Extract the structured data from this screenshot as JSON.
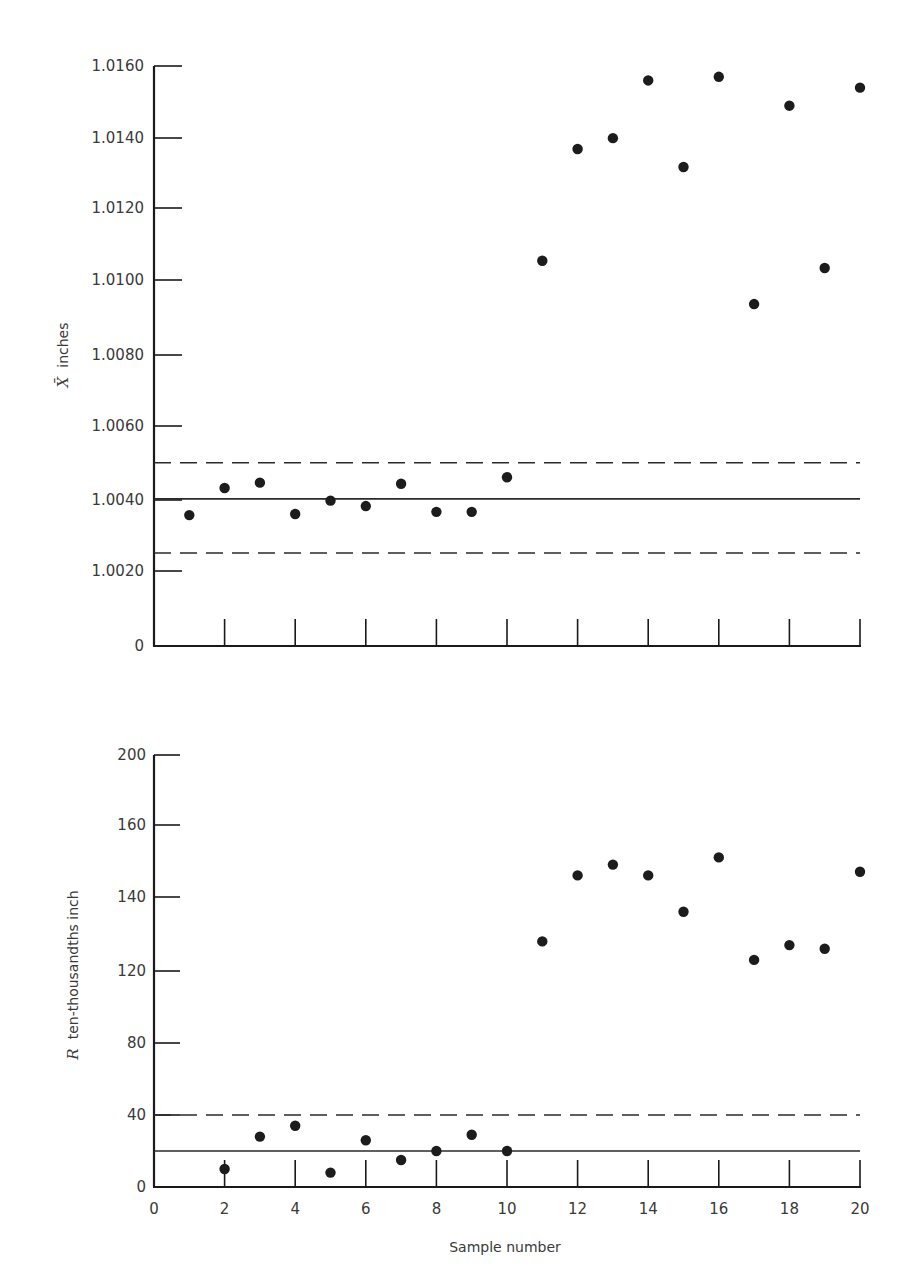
{
  "chart_data": [
    {
      "type": "scatter",
      "title": "",
      "xlabel": "",
      "ylabel": "X̄ inches",
      "ylabel_symbol": "X̄",
      "ylabel_text": "inches",
      "y_ticks": [
        "0",
        "1.0020",
        "1.0040",
        "1.0060",
        "1.0080",
        "1.0100",
        "1.0120",
        "1.0140",
        "1.0160"
      ],
      "y_tick_values": [
        0,
        1.002,
        1.004,
        1.006,
        1.008,
        1.01,
        1.012,
        1.014,
        1.016
      ],
      "x_ticks": [
        2,
        4,
        6,
        8,
        10,
        12,
        14,
        16,
        18,
        20
      ],
      "x_tick_labels_shown": false,
      "ylim": [
        1.0,
        1.016
      ],
      "xlim": [
        0,
        20
      ],
      "grid": false,
      "x": [
        1,
        2,
        3,
        4,
        5,
        6,
        7,
        8,
        9,
        10,
        11,
        12,
        13,
        14,
        15,
        16,
        17,
        18,
        19,
        20
      ],
      "values": [
        1.00355,
        1.0043,
        1.00445,
        1.00358,
        1.00395,
        1.0038,
        1.00442,
        1.00364,
        1.00364,
        1.0046,
        1.0106,
        1.0137,
        1.014,
        1.0156,
        1.0132,
        1.0157,
        1.0094,
        1.0149,
        1.0104,
        1.0154
      ],
      "reference_lines": [
        {
          "name": "UCL",
          "style": "dashed",
          "value": 1.005
        },
        {
          "name": "Center line",
          "style": "solid",
          "value": 1.004
        },
        {
          "name": "LCL",
          "style": "dashed",
          "value": 1.0025
        }
      ]
    },
    {
      "type": "scatter",
      "title": "",
      "xlabel": "Sample number",
      "ylabel": "R ten-thousandths inch",
      "ylabel_symbol": "R",
      "ylabel_text": "ten-thousandths inch",
      "y_ticks": [
        "0",
        "40",
        "80",
        "120",
        "140",
        "160",
        "200"
      ],
      "y_tick_values": [
        0,
        40,
        80,
        120,
        140,
        160,
        200
      ],
      "x_ticks": [
        0,
        2,
        4,
        6,
        8,
        10,
        12,
        14,
        16,
        18,
        20
      ],
      "x_tick_labels": [
        "0",
        "2",
        "4",
        "6",
        "8",
        "10",
        "12",
        "14",
        "16",
        "18",
        "20"
      ],
      "xlim": [
        0,
        20
      ],
      "grid": false,
      "x": [
        2,
        3,
        4,
        5,
        6,
        7,
        8,
        9,
        10,
        11,
        12,
        13,
        14,
        15,
        16,
        17,
        18,
        19,
        20
      ],
      "values": [
        10,
        28,
        34,
        8,
        26,
        15,
        20,
        29,
        20,
        128,
        146,
        149,
        146,
        136,
        151,
        123,
        127,
        126,
        147
      ],
      "reference_lines": [
        {
          "name": "UCL",
          "style": "dashed",
          "value": 40
        },
        {
          "name": "Center line",
          "style": "solid",
          "value": 20
        }
      ]
    }
  ],
  "top_chart": {
    "ylabel_symbol": "X̄",
    "ylabel_text": "inches",
    "y_tick_labels": [
      "1.0160",
      "1.0140",
      "1.0120",
      "1.0100",
      "1.0080",
      "1.0060",
      "1.0040",
      "1.0020",
      "0"
    ]
  },
  "bottom_chart": {
    "ylabel_symbol": "R",
    "ylabel_text": "ten-thousandths inch",
    "y_tick_labels": [
      "200",
      "160",
      "140",
      "120",
      "80",
      "40",
      "0"
    ],
    "x_tick_labels": [
      "0",
      "2",
      "4",
      "6",
      "8",
      "10",
      "12",
      "14",
      "16",
      "18",
      "20"
    ],
    "xlabel": "Sample number"
  }
}
